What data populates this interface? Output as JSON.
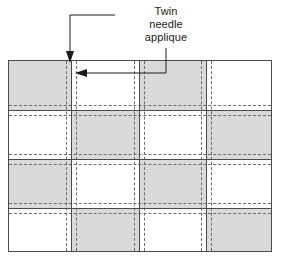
{
  "figure": {
    "width": 284,
    "height": 260,
    "background": "#ffffff"
  },
  "annotation": {
    "label_lines": [
      "Twin",
      "needle",
      "applique"
    ],
    "line1": "Twin",
    "line2": "needle",
    "line3": "applique",
    "leader_color": "#1a1a1a",
    "arrows": [
      {
        "name": "down-arrow-to-seam",
        "direction": "down",
        "tip_x": 70,
        "tip_y": 62
      },
      {
        "name": "left-arrow-to-stitch",
        "direction": "left",
        "tip_x": 75,
        "tip_y": 73
      }
    ]
  },
  "panel": {
    "frame_color": "#4a4a4a",
    "shaded_color": "#d9d9d9",
    "plain_color": "#ffffff",
    "seam_color": "#4a4a4a",
    "stitch_color": "#6b6b6b",
    "columns": 4,
    "rows": 4,
    "column_edges": [
      0,
      62,
      130,
      197,
      264
    ],
    "row_edges": [
      0,
      49,
      98,
      147,
      192
    ],
    "vertical_seams": [
      62,
      130,
      197
    ],
    "horizontal_seams": [
      49,
      98,
      147
    ],
    "stitch_offset": 5,
    "checkerboard": [
      [
        "shaded",
        "plain",
        "shaded",
        "plain"
      ],
      [
        "plain",
        "shaded",
        "plain",
        "shaded"
      ],
      [
        "shaded",
        "plain",
        "shaded",
        "plain"
      ],
      [
        "plain",
        "shaded",
        "plain",
        "shaded"
      ]
    ]
  }
}
